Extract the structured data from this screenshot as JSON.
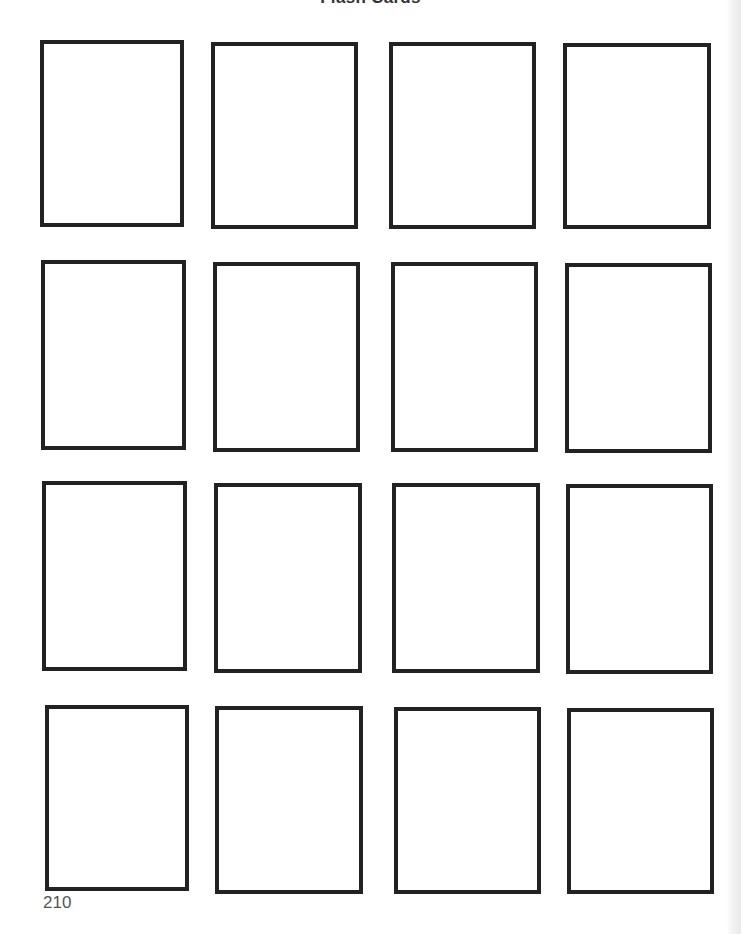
{
  "page": {
    "title": "Flash Cards",
    "page_number": "210",
    "border_color": "#222222",
    "background_color": "#ffffff"
  },
  "grid": {
    "rows": 4,
    "columns": 4,
    "cards": [
      {
        "row": 1,
        "col": 1,
        "label": ""
      },
      {
        "row": 1,
        "col": 2,
        "label": ""
      },
      {
        "row": 1,
        "col": 3,
        "label": ""
      },
      {
        "row": 1,
        "col": 4,
        "label": ""
      },
      {
        "row": 2,
        "col": 1,
        "label": ""
      },
      {
        "row": 2,
        "col": 2,
        "label": ""
      },
      {
        "row": 2,
        "col": 3,
        "label": ""
      },
      {
        "row": 2,
        "col": 4,
        "label": ""
      },
      {
        "row": 3,
        "col": 1,
        "label": ""
      },
      {
        "row": 3,
        "col": 2,
        "label": ""
      },
      {
        "row": 3,
        "col": 3,
        "label": ""
      },
      {
        "row": 3,
        "col": 4,
        "label": ""
      },
      {
        "row": 4,
        "col": 1,
        "label": ""
      },
      {
        "row": 4,
        "col": 2,
        "label": ""
      },
      {
        "row": 4,
        "col": 3,
        "label": ""
      },
      {
        "row": 4,
        "col": 4,
        "label": ""
      }
    ]
  }
}
